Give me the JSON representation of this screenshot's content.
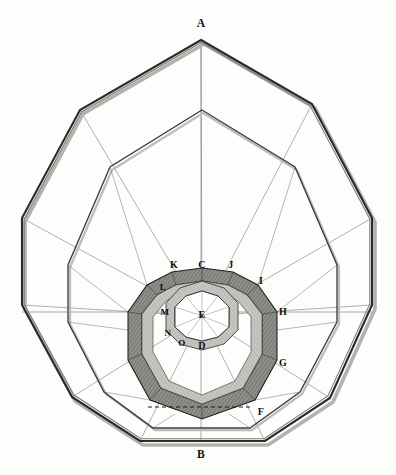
{
  "figure": {
    "background_color": "#fdfdfc",
    "ink_color": "#1a1a1a",
    "thin_line_color": "#555555",
    "band_fill_dark": "#8d8d8d",
    "band_fill_light": "#c9c9c6",
    "shadow_color": "#9a9a97"
  },
  "labels": [
    {
      "id": "A",
      "text": "A",
      "x": 201,
      "y": 24,
      "size": "lbl-lg",
      "note": "outer polygon apex, top"
    },
    {
      "id": "B",
      "text": "B",
      "x": 201,
      "y": 455,
      "size": "lbl-lg",
      "note": "outer polygon vertex, bottom"
    },
    {
      "id": "C",
      "text": "C",
      "x": 202,
      "y": 265,
      "size": "lbl-md",
      "note": "inner ring top vertex"
    },
    {
      "id": "D",
      "text": "D",
      "x": 202,
      "y": 346,
      "size": "lbl-md",
      "note": "inner ring bottom vertex"
    },
    {
      "id": "E",
      "text": "E",
      "x": 202,
      "y": 315,
      "size": "lbl-md",
      "note": "center point"
    },
    {
      "id": "F",
      "text": "F",
      "x": 261,
      "y": 412,
      "size": "lbl-md",
      "note": "lower right"
    },
    {
      "id": "G",
      "text": "G",
      "x": 283,
      "y": 363,
      "size": "lbl-md",
      "note": "right lower"
    },
    {
      "id": "H",
      "text": "H",
      "x": 283,
      "y": 312,
      "size": "lbl-md",
      "note": "right, on horizontal axis"
    },
    {
      "id": "I",
      "text": "I",
      "x": 261,
      "y": 281,
      "size": "lbl-md",
      "note": "upper right"
    },
    {
      "id": "J",
      "text": "J",
      "x": 231,
      "y": 265,
      "size": "lbl-md",
      "note": "inner ring upper right"
    },
    {
      "id": "K",
      "text": "K",
      "x": 174,
      "y": 265,
      "size": "lbl-md",
      "note": "inner ring upper left"
    },
    {
      "id": "L",
      "text": "L",
      "x": 163,
      "y": 287,
      "size": "lbl-sm",
      "note": "inner left upper"
    },
    {
      "id": "M",
      "text": "M",
      "x": 165,
      "y": 312,
      "size": "lbl-sm",
      "note": "inner left, on horizontal axis"
    },
    {
      "id": "N",
      "text": "N",
      "x": 168,
      "y": 333,
      "size": "lbl-sm",
      "note": "inner left lower"
    },
    {
      "id": "O",
      "text": "O",
      "x": 182,
      "y": 343,
      "size": "lbl-sm",
      "note": "inner lower left"
    }
  ],
  "geometry": {
    "center": {
      "x": 202,
      "y": 316
    },
    "outer_polygon": {
      "name": "outermost decagon",
      "stroke": "#1a1a1a",
      "vertices": [
        {
          "x": 201,
          "y": 40
        },
        {
          "x": 312,
          "y": 104
        },
        {
          "x": 372,
          "y": 218
        },
        {
          "x": 372,
          "y": 305
        },
        {
          "x": 330,
          "y": 398
        },
        {
          "x": 265,
          "y": 441
        },
        {
          "x": 140,
          "y": 441
        },
        {
          "x": 72,
          "y": 397
        },
        {
          "x": 22,
          "y": 305
        },
        {
          "x": 22,
          "y": 218
        },
        {
          "x": 80,
          "y": 110
        }
      ]
    },
    "middle_polygon": {
      "name": "middle decagon",
      "stroke": "#3b3b3b",
      "vertices": [
        {
          "x": 202,
          "y": 110
        },
        {
          "x": 295,
          "y": 167
        },
        {
          "x": 337,
          "y": 265
        },
        {
          "x": 337,
          "y": 322
        },
        {
          "x": 300,
          "y": 392
        },
        {
          "x": 250,
          "y": 428
        },
        {
          "x": 153,
          "y": 428
        },
        {
          "x": 104,
          "y": 392
        },
        {
          "x": 68,
          "y": 322
        },
        {
          "x": 68,
          "y": 265
        },
        {
          "x": 110,
          "y": 167
        }
      ]
    },
    "ring_outer": {
      "name": "shaded outer ring (K J I H G F ...)",
      "outer_vertices": [
        {
          "x": 202,
          "y": 268
        },
        {
          "x": 233,
          "y": 272
        },
        {
          "x": 258,
          "y": 285
        },
        {
          "x": 277,
          "y": 312
        },
        {
          "x": 277,
          "y": 360
        },
        {
          "x": 255,
          "y": 400
        },
        {
          "x": 202,
          "y": 419
        },
        {
          "x": 150,
          "y": 400
        },
        {
          "x": 128,
          "y": 360
        },
        {
          "x": 128,
          "y": 312
        },
        {
          "x": 147,
          "y": 285
        },
        {
          "x": 172,
          "y": 272
        }
      ],
      "inner_vertices": [
        {
          "x": 202,
          "y": 281
        },
        {
          "x": 228,
          "y": 285
        },
        {
          "x": 247,
          "y": 295
        },
        {
          "x": 262,
          "y": 314
        },
        {
          "x": 262,
          "y": 354
        },
        {
          "x": 243,
          "y": 388
        },
        {
          "x": 202,
          "y": 404
        },
        {
          "x": 161,
          "y": 388
        },
        {
          "x": 142,
          "y": 354
        },
        {
          "x": 142,
          "y": 314
        },
        {
          "x": 157,
          "y": 295
        },
        {
          "x": 176,
          "y": 285
        }
      ]
    },
    "ring_inner": {
      "name": "shaded inner ring (C D E core)",
      "outer_vertices": [
        {
          "x": 202,
          "y": 281
        },
        {
          "x": 224,
          "y": 288
        },
        {
          "x": 238,
          "y": 303
        },
        {
          "x": 238,
          "y": 330
        },
        {
          "x": 224,
          "y": 344
        },
        {
          "x": 202,
          "y": 350
        },
        {
          "x": 180,
          "y": 344
        },
        {
          "x": 166,
          "y": 330
        },
        {
          "x": 166,
          "y": 303
        },
        {
          "x": 180,
          "y": 288
        }
      ],
      "inner_vertices": [
        {
          "x": 202,
          "y": 291
        },
        {
          "x": 218,
          "y": 296
        },
        {
          "x": 229,
          "y": 307
        },
        {
          "x": 229,
          "y": 327
        },
        {
          "x": 218,
          "y": 337
        },
        {
          "x": 202,
          "y": 341
        },
        {
          "x": 186,
          "y": 337
        },
        {
          "x": 175,
          "y": 327
        },
        {
          "x": 175,
          "y": 307
        },
        {
          "x": 186,
          "y": 296
        }
      ]
    },
    "dashed_chord": {
      "x1": 148,
      "y1": 407,
      "x2": 252,
      "y2": 407
    },
    "axes": {
      "vertical": {
        "x1": 201,
        "y1": 40,
        "x2": 201,
        "y2": 441
      },
      "horizontal": {
        "x1": 22,
        "y1": 312,
        "x2": 372,
        "y2": 312
      }
    }
  }
}
